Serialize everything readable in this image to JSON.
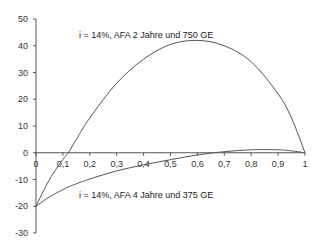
{
  "chart_data": {
    "type": "line",
    "title": "",
    "xlabel": "",
    "ylabel": "",
    "xlim": [
      0,
      1
    ],
    "ylim": [
      -30,
      50
    ],
    "grid": false,
    "legend": "none (inline annotations)",
    "x_ticks": [
      "0",
      "0,1",
      "0,2",
      "0,3",
      "0,4",
      "0,5",
      "0,6",
      "0,7",
      "0,8",
      "0,9",
      "1"
    ],
    "y_ticks": [
      "50",
      "40",
      "30",
      "20",
      "10",
      "0",
      "-10",
      "-20",
      "-30"
    ],
    "x": [
      0,
      0.05,
      0.1,
      0.12,
      0.15,
      0.2,
      0.3,
      0.4,
      0.5,
      0.6,
      0.7,
      0.8,
      0.9,
      0.95,
      1.0
    ],
    "series": [
      {
        "name": "i = 14%,  AFA 2 Jahre und 750 GE",
        "values": [
          -20,
          -10,
          -2.5,
          0,
          5,
          13,
          26,
          35,
          40.5,
          42,
          40,
          34,
          22,
          13,
          0
        ]
      },
      {
        "name": "i = 14%, AFA 4 Jahre und 375 GE",
        "values": [
          -20,
          -16.5,
          -13.8,
          -12.8,
          -11.6,
          -9.8,
          -6.8,
          -4.5,
          -2.6,
          -0.8,
          0.4,
          1.1,
          1.1,
          0.7,
          0
        ]
      }
    ],
    "annotations": [
      {
        "text": "i = 14%,  AFA 2 Jahre und 750 GE",
        "x": 0.16,
        "y": 43
      },
      {
        "text": "i = 14%, AFA 4 Jahre und 375 GE",
        "x": 0.16,
        "y": -17
      }
    ]
  }
}
